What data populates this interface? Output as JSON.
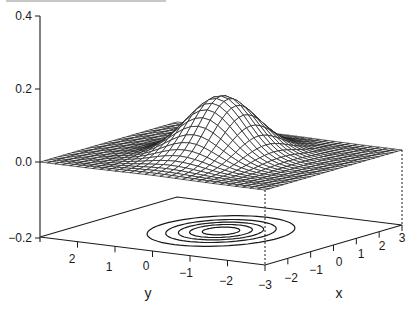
{
  "chart_data": {
    "type": "surface",
    "title": "",
    "function": "bivariate normal density, mean (0,0), sd_x 1, sd_y ~0.7 (elongated along x), peak ~0.16",
    "x": {
      "label": "x",
      "range": [
        -3,
        3
      ],
      "ticks": [
        -3,
        -2,
        -1,
        0,
        1,
        2,
        3
      ]
    },
    "y": {
      "label": "y",
      "range": [
        -3,
        3
      ],
      "ticks": [
        2,
        1,
        0,
        -1,
        -2
      ]
    },
    "z": {
      "label": "",
      "range": [
        -0.2,
        0.4
      ],
      "ticks": [
        0.4,
        0.2,
        0.0,
        -0.2
      ],
      "tick_labels": [
        "0.4",
        "0.2",
        "0.0",
        "-0.2"
      ]
    },
    "surface": {
      "peak_z": 0.16,
      "sigma_x": 1.0,
      "sigma_y": 0.75,
      "grid_lines": 31
    },
    "contours": {
      "plane_z": -0.2,
      "levels": [
        0.02,
        0.05,
        0.08,
        0.11,
        0.14
      ],
      "count": 5
    },
    "projection_lines": "dashed vertical lines from mesh corners to floor"
  },
  "axes": {
    "z_ticks": [
      "0.4",
      "0.2",
      "0.0",
      "−0.2"
    ],
    "x_ticks": [
      "−3",
      "−2",
      "−1",
      "0",
      "1",
      "2",
      "3"
    ],
    "y_ticks": [
      "2",
      "1",
      "0",
      "−1",
      "−2"
    ],
    "x_label": "x",
    "y_label": "y"
  }
}
